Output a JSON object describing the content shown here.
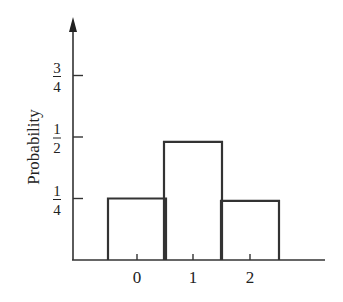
{
  "chart_data": {
    "type": "bar",
    "title": "",
    "xlabel": "",
    "ylabel": "Probability",
    "categories": [
      "0",
      "1",
      "2"
    ],
    "values": [
      0.25,
      0.48,
      0.24
    ],
    "yticks": [
      {
        "value": 0.25,
        "num": "1",
        "den": "4"
      },
      {
        "value": 0.5,
        "num": "1",
        "den": "2"
      },
      {
        "value": 0.75,
        "num": "3",
        "den": "4"
      }
    ],
    "ylim": [
      0,
      0.95
    ],
    "grid": false,
    "legend": null,
    "bar_style": "outline histogram, adjacent bars, no fill"
  },
  "colors": {
    "stroke": "#333333",
    "background": "#ffffff"
  }
}
